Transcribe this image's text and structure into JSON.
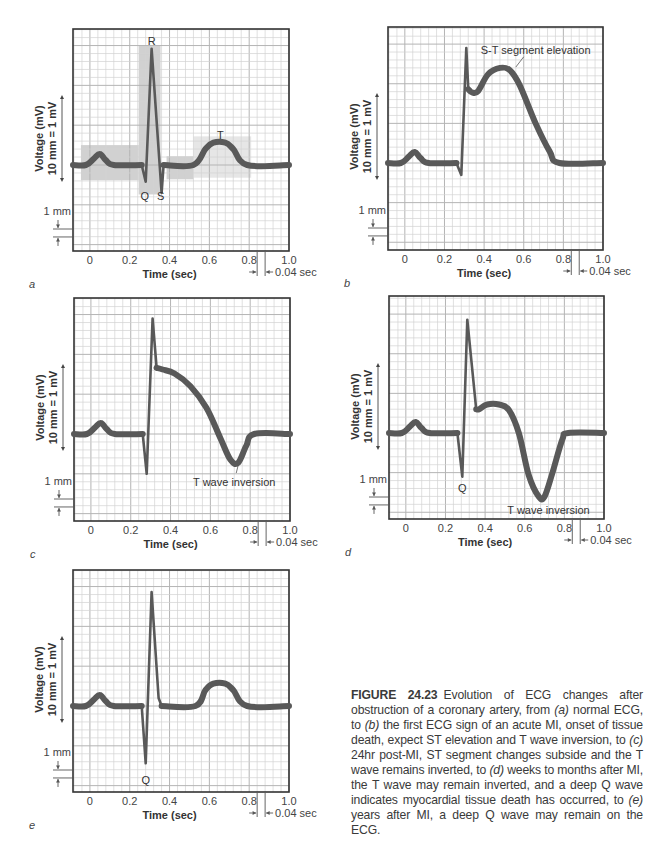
{
  "figure": {
    "number": "FIGURE 24.23",
    "caption_parts": [
      {
        "t": "Evolution of ECG changes after obstruction of a coronary artery, from ",
        "i": false
      },
      {
        "t": "(a)",
        "i": true
      },
      {
        "t": " normal ECG, to ",
        "i": false
      },
      {
        "t": "(b)",
        "i": true
      },
      {
        "t": " the first ECG sign of an acute MI, onset of tissue death, expect ST elevation and T wave inversion, to ",
        "i": false
      },
      {
        "t": "(c)",
        "i": true
      },
      {
        "t": " 24hr post-MI, ST segment changes subside and the T wave remains inverted, to ",
        "i": false
      },
      {
        "t": "(d)",
        "i": true
      },
      {
        "t": " weeks to months after MI, the T wave may remain inverted, and a deep Q wave indicates myocardial tissue death has occurred, to ",
        "i": false
      },
      {
        "t": "(e)",
        "i": true
      },
      {
        "t": " years after MI, a deep Q wave may remain on the ECG.",
        "i": false
      }
    ]
  },
  "colors": {
    "trace": "#595959",
    "grid_minor": "#d2d2d2",
    "grid_major": "#b4b4b4",
    "frame": "#333333",
    "shade_dark": "#c9c9c9",
    "shade_light": "#e2e2e2"
  },
  "common": {
    "ylabel_line1": "Voltage (mV)",
    "ylabel_line2": "10 mm = 1 mV",
    "xlabel": "Time (sec)",
    "mm_label": "1 mm",
    "sec_label": "0.04 sec",
    "x_ticks": [
      "0",
      "0.2",
      "0.4",
      "0.6",
      "0.8",
      "1.0"
    ],
    "x_tick_values": [
      0,
      0.2,
      0.4,
      0.6,
      0.8,
      1.0
    ],
    "x_range": [
      -0.085,
      1.0
    ],
    "minor_grid_sec": 0.04,
    "minor_grid_mm": 1
  },
  "chart_data": [
    {
      "type": "line",
      "panel": "a",
      "title": "Normal ECG",
      "xlabel": "Time (sec)",
      "ylabel": "Voltage (mV) 10 mm = 1 mV",
      "xlim": [
        -0.085,
        1.0
      ],
      "grid": true,
      "box": {
        "x": 73,
        "y": 29,
        "w": 216,
        "h": 222
      },
      "baseline_y": 165,
      "thin_range": [
        0.26,
        0.37
      ],
      "points": [
        [
          -0.085,
          0
        ],
        [
          -0.02,
          0
        ],
        [
          0.02,
          0.8
        ],
        [
          0.05,
          1.4
        ],
        [
          0.08,
          0.6
        ],
        [
          0.12,
          0
        ],
        [
          0.26,
          0
        ],
        [
          0.28,
          -2.1
        ],
        [
          0.31,
          14.6
        ],
        [
          0.36,
          -3.5
        ],
        [
          0.37,
          0
        ],
        [
          0.52,
          0
        ],
        [
          0.58,
          2.0
        ],
        [
          0.62,
          2.8
        ],
        [
          0.68,
          2.8
        ],
        [
          0.72,
          2.0
        ],
        [
          0.79,
          0
        ],
        [
          1.0,
          0
        ]
      ],
      "labels": [
        {
          "text": "R",
          "t": 0.31,
          "mv": 15.6
        },
        {
          "text": "Q",
          "t": 0.275,
          "mv": -3.9
        },
        {
          "text": "S",
          "t": 0.355,
          "mv": -3.9
        },
        {
          "text": "T",
          "t": 0.655,
          "mv": 3.8
        }
      ],
      "shaded_regions": [
        {
          "name": "P wave region",
          "t0": -0.045,
          "t1": 0.245,
          "mv0": -1.9,
          "mv1": 2.5,
          "tone": "dark"
        },
        {
          "name": "QRS complex",
          "t0": 0.245,
          "t1": 0.355,
          "mv0": -3.7,
          "mv1": 15.0,
          "tone": "dark"
        },
        {
          "name": "ST segment",
          "t0": 0.385,
          "t1": 0.52,
          "mv0": -1.8,
          "mv1": 1.1,
          "tone": "dark"
        },
        {
          "name": "T wave region",
          "t0": 0.52,
          "t1": 0.81,
          "mv0": -1.6,
          "mv1": 3.6,
          "tone": "light"
        }
      ]
    },
    {
      "type": "line",
      "panel": "b",
      "title": "Acute MI — S-T segment elevation",
      "xlabel": "Time (sec)",
      "ylabel": "Voltage (mV) 10 mm = 1 mV",
      "xlim": [
        -0.085,
        1.0
      ],
      "grid": true,
      "box": {
        "x": 388,
        "y": 27,
        "w": 215,
        "h": 223
      },
      "baseline_y": 163,
      "thin_range": [
        0.26,
        0.32
      ],
      "points": [
        [
          -0.085,
          0
        ],
        [
          -0.02,
          0
        ],
        [
          0.02,
          0.8
        ],
        [
          0.05,
          1.4
        ],
        [
          0.08,
          0.6
        ],
        [
          0.12,
          0
        ],
        [
          0.26,
          0
        ],
        [
          0.285,
          -1.5
        ],
        [
          0.31,
          14.5
        ],
        [
          0.32,
          9.3
        ],
        [
          0.34,
          8.9
        ],
        [
          0.37,
          9.1
        ],
        [
          0.42,
          11.2
        ],
        [
          0.48,
          12.0
        ],
        [
          0.53,
          11.7
        ],
        [
          0.58,
          9.8
        ],
        [
          0.66,
          5.0
        ],
        [
          0.73,
          1.5
        ],
        [
          0.78,
          0
        ],
        [
          1.0,
          0
        ]
      ],
      "labels": [
        {
          "text": "S-T segment elevation",
          "t": 0.66,
          "mv": 14.2,
          "leader": [
            [
              0.56,
              12.1
            ],
            [
              0.6,
              13.4
            ]
          ]
        }
      ]
    },
    {
      "type": "line",
      "panel": "c",
      "title": "24hr post-MI — T wave inversion",
      "xlabel": "Time (sec)",
      "ylabel": "Voltage (mV) 10 mm = 1 mV",
      "xlim": [
        -0.085,
        1.0
      ],
      "grid": true,
      "box": {
        "x": 74,
        "y": 298,
        "w": 216,
        "h": 223
      },
      "baseline_y": 434,
      "thin_range": [
        0.26,
        0.33
      ],
      "points": [
        [
          -0.085,
          0
        ],
        [
          -0.02,
          0
        ],
        [
          0.02,
          0.8
        ],
        [
          0.05,
          1.4
        ],
        [
          0.08,
          0.6
        ],
        [
          0.12,
          0
        ],
        [
          0.26,
          0
        ],
        [
          0.28,
          -5.0
        ],
        [
          0.31,
          14.5
        ],
        [
          0.33,
          8.3
        ],
        [
          0.36,
          8.1
        ],
        [
          0.42,
          7.6
        ],
        [
          0.5,
          6.0
        ],
        [
          0.58,
          3.3
        ],
        [
          0.65,
          -0.5
        ],
        [
          0.7,
          -3.2
        ],
        [
          0.74,
          -3.6
        ],
        [
          0.78,
          -1.5
        ],
        [
          0.82,
          0
        ],
        [
          1.0,
          0
        ]
      ],
      "labels": [
        {
          "text": "T wave inversion",
          "t": 0.72,
          "mv": -6.0,
          "leader": [
            [
              0.74,
              -3.9
            ],
            [
              0.73,
              -4.9
            ]
          ]
        }
      ]
    },
    {
      "type": "line",
      "panel": "d",
      "title": "Weeks to months after MI — deep Q wave, T wave inversion",
      "xlabel": "Time (sec)",
      "ylabel": "Voltage (mV) 10 mm = 1 mV",
      "xlim": [
        -0.085,
        1.0
      ],
      "grid": true,
      "box": {
        "x": 389,
        "y": 296,
        "w": 215,
        "h": 223
      },
      "baseline_y": 433,
      "thin_range": [
        0.26,
        0.36
      ],
      "points": [
        [
          -0.085,
          0
        ],
        [
          -0.02,
          0
        ],
        [
          0.02,
          0.8
        ],
        [
          0.05,
          1.4
        ],
        [
          0.08,
          0.6
        ],
        [
          0.12,
          0
        ],
        [
          0.26,
          0
        ],
        [
          0.285,
          -5.5
        ],
        [
          0.31,
          14.3
        ],
        [
          0.355,
          3.0
        ],
        [
          0.37,
          3.0
        ],
        [
          0.41,
          3.6
        ],
        [
          0.47,
          3.6
        ],
        [
          0.52,
          2.9
        ],
        [
          0.57,
          0.0
        ],
        [
          0.62,
          -5.3
        ],
        [
          0.67,
          -8.0
        ],
        [
          0.7,
          -8.0
        ],
        [
          0.74,
          -5.0
        ],
        [
          0.79,
          -0.8
        ],
        [
          0.82,
          0
        ],
        [
          1.0,
          0
        ]
      ],
      "labels": [
        {
          "text": "Q",
          "t": 0.285,
          "mv": -6.9
        },
        {
          "text": "T wave inversion",
          "t": 0.72,
          "mv": -9.7
        }
      ]
    },
    {
      "type": "line",
      "panel": "e",
      "title": "Years after MI — deep Q wave remains",
      "xlabel": "Time (sec)",
      "ylabel": "Voltage (mV) 10 mm = 1 mV",
      "xlim": [
        -0.085,
        1.0
      ],
      "grid": true,
      "box": {
        "x": 73,
        "y": 570,
        "w": 216,
        "h": 222
      },
      "baseline_y": 706,
      "thin_range": [
        0.26,
        0.36
      ],
      "points": [
        [
          -0.085,
          0
        ],
        [
          -0.02,
          0
        ],
        [
          0.02,
          0.8
        ],
        [
          0.05,
          1.4
        ],
        [
          0.08,
          0.6
        ],
        [
          0.12,
          0
        ],
        [
          0.26,
          0
        ],
        [
          0.28,
          -7.2
        ],
        [
          0.31,
          14.3
        ],
        [
          0.345,
          1.0
        ],
        [
          0.36,
          0
        ],
        [
          0.53,
          0
        ],
        [
          0.58,
          2.0
        ],
        [
          0.62,
          2.8
        ],
        [
          0.68,
          2.8
        ],
        [
          0.72,
          2.0
        ],
        [
          0.79,
          0
        ],
        [
          1.0,
          0
        ]
      ],
      "labels": [
        {
          "text": "Q",
          "t": 0.28,
          "mv": -9.3
        }
      ]
    }
  ]
}
